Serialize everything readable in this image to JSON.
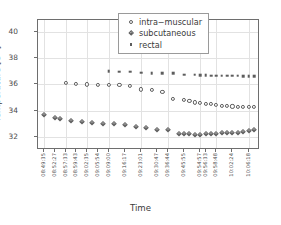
{
  "chart_data": {
    "type": "scatter",
    "title": "",
    "xlabel": "Time",
    "ylabel": "Temperature [C °]",
    "ylim": [
      31.0,
      40.9
    ],
    "yticks": [
      32,
      34,
      36,
      38,
      40
    ],
    "grid": true,
    "legend_position": "top-right",
    "x_tick_labels": [
      "08:49:35",
      "08:52:27",
      "08:57:33",
      "08:59:43",
      "09:02:35",
      "09:05:54",
      "09:09:00",
      "09:16:17",
      "09:23:01",
      "09:30:47",
      "09:36:44",
      "09:45:55",
      "09:54:57",
      "09:56:33",
      "09:58:48",
      "10:02:24",
      "10:06:18"
    ],
    "x_tick_indices": [
      0,
      2,
      4,
      6,
      8,
      10,
      12,
      15,
      18,
      21,
      23,
      26,
      29,
      30,
      32,
      35,
      38
    ],
    "n_points": 40,
    "series": [
      {
        "name": "intra−muscular",
        "marker": "open-circle",
        "color": "#5d5d5d",
        "points": [
          {
            "i": 4,
            "y": 36.12
          },
          {
            "i": 6,
            "y": 36.05
          },
          {
            "i": 8,
            "y": 36.0
          },
          {
            "i": 10,
            "y": 35.97
          },
          {
            "i": 12,
            "y": 35.95
          },
          {
            "i": 14,
            "y": 35.93
          },
          {
            "i": 16,
            "y": 35.88
          },
          {
            "i": 18,
            "y": 35.62
          },
          {
            "i": 20,
            "y": 35.57
          },
          {
            "i": 22,
            "y": 35.44
          },
          {
            "i": 24,
            "y": 34.92
          },
          {
            "i": 26,
            "y": 34.82
          },
          {
            "i": 27,
            "y": 34.75
          },
          {
            "i": 28,
            "y": 34.62
          },
          {
            "i": 29,
            "y": 34.58
          },
          {
            "i": 30,
            "y": 34.52
          },
          {
            "i": 31,
            "y": 34.48
          },
          {
            "i": 32,
            "y": 34.42
          },
          {
            "i": 33,
            "y": 34.38
          },
          {
            "i": 34,
            "y": 34.36
          },
          {
            "i": 35,
            "y": 34.32
          },
          {
            "i": 36,
            "y": 34.3
          },
          {
            "i": 37,
            "y": 34.29
          },
          {
            "i": 38,
            "y": 34.29
          },
          {
            "i": 39,
            "y": 34.3
          }
        ]
      },
      {
        "name": "subcutaneous",
        "marker": "open-diamond",
        "color": "#5d5d5d",
        "points": [
          {
            "i": 0,
            "y": 33.68
          },
          {
            "i": 2,
            "y": 33.4
          },
          {
            "i": 3,
            "y": 33.34
          },
          {
            "i": 5,
            "y": 33.22
          },
          {
            "i": 7,
            "y": 33.14
          },
          {
            "i": 9,
            "y": 33.02
          },
          {
            "i": 11,
            "y": 33.0
          },
          {
            "i": 13,
            "y": 32.96
          },
          {
            "i": 15,
            "y": 32.92
          },
          {
            "i": 17,
            "y": 32.76
          },
          {
            "i": 19,
            "y": 32.7
          },
          {
            "i": 21,
            "y": 32.56
          },
          {
            "i": 23,
            "y": 32.5
          },
          {
            "i": 25,
            "y": 32.24
          },
          {
            "i": 26,
            "y": 32.22
          },
          {
            "i": 27,
            "y": 32.21
          },
          {
            "i": 28,
            "y": 32.18
          },
          {
            "i": 29,
            "y": 32.17
          },
          {
            "i": 30,
            "y": 32.19
          },
          {
            "i": 31,
            "y": 32.22
          },
          {
            "i": 32,
            "y": 32.24
          },
          {
            "i": 33,
            "y": 32.28
          },
          {
            "i": 34,
            "y": 32.3
          },
          {
            "i": 35,
            "y": 32.31
          },
          {
            "i": 36,
            "y": 32.3
          },
          {
            "i": 37,
            "y": 32.36
          },
          {
            "i": 38,
            "y": 32.44
          },
          {
            "i": 39,
            "y": 32.52
          }
        ]
      },
      {
        "name": "rectal",
        "marker": "filled-square",
        "color": "#5d5d5d",
        "points": [
          {
            "i": 12,
            "y": 36.98
          },
          {
            "i": 14,
            "y": 36.97
          },
          {
            "i": 16,
            "y": 36.95
          },
          {
            "i": 18,
            "y": 36.88
          },
          {
            "i": 20,
            "y": 36.86
          },
          {
            "i": 22,
            "y": 36.86
          },
          {
            "i": 24,
            "y": 36.85
          },
          {
            "i": 26,
            "y": 36.74
          },
          {
            "i": 28,
            "y": 36.72
          },
          {
            "i": 29,
            "y": 36.7
          },
          {
            "i": 30,
            "y": 36.68
          },
          {
            "i": 31,
            "y": 36.67
          },
          {
            "i": 32,
            "y": 36.66
          },
          {
            "i": 33,
            "y": 36.66
          },
          {
            "i": 34,
            "y": 36.66
          },
          {
            "i": 35,
            "y": 36.65
          },
          {
            "i": 36,
            "y": 36.65
          },
          {
            "i": 37,
            "y": 36.64
          },
          {
            "i": 38,
            "y": 36.64
          },
          {
            "i": 39,
            "y": 36.64
          }
        ]
      }
    ]
  },
  "legend": {
    "items": [
      {
        "label": "intra−muscular",
        "marker": "open-circle"
      },
      {
        "label": "subcutaneous",
        "marker": "open-diamond"
      },
      {
        "label": "rectal",
        "marker": "filled-square"
      }
    ]
  },
  "axes": {
    "y_title_main": "Temperature [C ",
    "y_title_sup": "o",
    "y_title_end": "]",
    "x_title": "Time"
  }
}
